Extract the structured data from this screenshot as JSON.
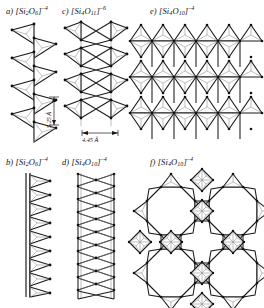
{
  "figure": {
    "background_color": "#ffffff",
    "line_color": "#1a1a1a",
    "inner_line_color": "#8a8a8a"
  },
  "panels": [
    {
      "id": "a",
      "label_prefix": "a)",
      "bracket_open": "[",
      "element": "Si",
      "element_sub": "2",
      "oxygen": "O",
      "oxygen_sub": "6",
      "bracket_close": "]",
      "charge": "–4",
      "full_label": "a) [Si2O6]–4",
      "structure_type": "single-chain-pyroxene",
      "repeat_units": 4,
      "dimension": {
        "value": "5.25 Å",
        "orientation": "vertical"
      }
    },
    {
      "id": "b",
      "label_prefix": "b)",
      "bracket_open": "[",
      "element": "Si",
      "element_sub": "2",
      "oxygen": "O",
      "oxygen_sub": "6",
      "bracket_close": "]",
      "charge": "–4",
      "full_label": "b) [Si2O6]–4",
      "structure_type": "single-chain-projection",
      "repeat_units": 9,
      "dimension": null
    },
    {
      "id": "c",
      "label_prefix": "c)",
      "bracket_open": "[",
      "element": "Si",
      "element_sub": "4",
      "oxygen": "O",
      "oxygen_sub": "11",
      "bracket_close": "]",
      "charge": "–6",
      "full_label": "c) [Si4O11]–6",
      "structure_type": "double-chain-amphibole",
      "repeat_units": 4,
      "dimension": {
        "value": "4.45 Å",
        "orientation": "horizontal"
      }
    },
    {
      "id": "d",
      "label_prefix": "d)",
      "bracket_open": "[",
      "element": "Si",
      "element_sub": "4",
      "oxygen": "O",
      "oxygen_sub": "10",
      "bracket_close": "]",
      "charge": "–4",
      "full_label": "d) [Si4O10]–4",
      "structure_type": "double-chain-projection",
      "repeat_units": 10,
      "dimension": null
    },
    {
      "id": "e",
      "label_prefix": "e)",
      "bracket_open": "[",
      "element": "Si",
      "element_sub": "4",
      "oxygen": "O",
      "oxygen_sub": "10",
      "bracket_close": "]",
      "charge": "–4",
      "full_label": "e) [Si4O10]–4",
      "structure_type": "hexagonal-sheet",
      "rings_across": 3,
      "rings_down": 3,
      "dimension": null
    },
    {
      "id": "f",
      "label_prefix": "f)",
      "bracket_open": "[",
      "element": "Si",
      "element_sub": "4",
      "oxygen": "O",
      "oxygen_sub": "10",
      "bracket_close": "]",
      "charge": "–4",
      "full_label": "f) [Si4O10]–4",
      "structure_type": "octagonal-four-ring-sheet",
      "rings_across": 2,
      "rings_down": 2,
      "dimension": null
    }
  ]
}
